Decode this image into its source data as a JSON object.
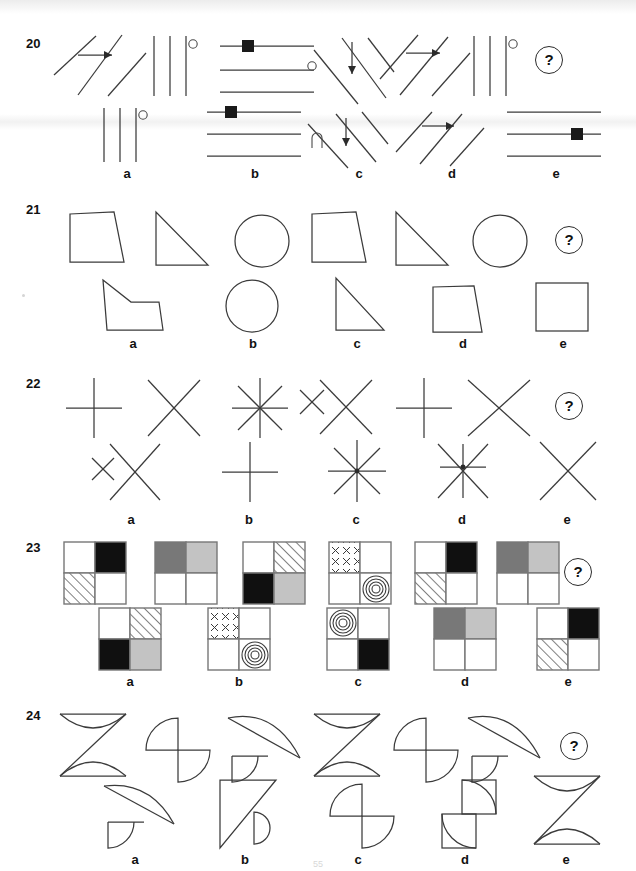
{
  "document": {
    "type": "non-verbal-reasoning-test",
    "page_number": "55",
    "question_mark_label": "?",
    "option_letters": [
      "a",
      "b",
      "c",
      "d",
      "e"
    ]
  },
  "rows": [
    {
      "number": "20",
      "theme": "line-groups",
      "problem_figures": [
        {
          "name": "three-diagonal-lines-with-arrow",
          "desc": "three parallel diagonal lines rising right, arrow pointing right"
        },
        {
          "name": "three-vertical-lines-with-circle",
          "desc": "three vertical lines, small open circle at top right"
        },
        {
          "name": "three-horizontal-lines-with-square",
          "desc": "three horizontal lines, small black square on top line"
        },
        {
          "name": "diagonal-lines-with-circle-and-down-arrow",
          "desc": "diagonal lines falling right, open circle left, down arrow"
        },
        {
          "name": "diagonal-lines-with-arrow-right",
          "desc": "three diagonal lines rising right, arrow pointing right"
        },
        {
          "name": "three-vertical-lines-with-circle-2",
          "desc": "three vertical lines, small open circle at top right"
        }
      ],
      "options": [
        {
          "letter": "a",
          "name": "three-vertical-lines-circle",
          "desc": "three vertical lines with small open circle"
        },
        {
          "letter": "b",
          "name": "three-horizontal-lines-square",
          "desc": "three horizontal lines with black square on top line"
        },
        {
          "letter": "c",
          "name": "diagonals-arc-down-arrow",
          "desc": "diagonal lines falling right with arc and down arrow"
        },
        {
          "letter": "d",
          "name": "diagonals-right-arrow",
          "desc": "diagonal lines rising right with right arrow"
        },
        {
          "letter": "e",
          "name": "three-horizontal-lines-square-low",
          "desc": "three horizontal lines with black square on bottom line"
        }
      ]
    },
    {
      "number": "21",
      "theme": "closed-shapes",
      "problem_figures": [
        {
          "name": "trapezoid",
          "desc": "trapezium, slanted right side"
        },
        {
          "name": "right-triangle",
          "desc": "right-angled triangle, vertical left edge"
        },
        {
          "name": "circle",
          "desc": "ellipse / circle"
        },
        {
          "name": "trapezoid-2",
          "desc": "trapezium, slanted right side"
        },
        {
          "name": "right-triangle-2",
          "desc": "right-angled triangle, vertical left edge"
        },
        {
          "name": "circle-2",
          "desc": "ellipse / circle"
        }
      ],
      "options": [
        {
          "letter": "a",
          "name": "irregular-pentagon",
          "desc": "irregular five-sided concave shape"
        },
        {
          "letter": "b",
          "name": "circle-option",
          "desc": "circle"
        },
        {
          "letter": "c",
          "name": "right-triangle-option",
          "desc": "right-angled triangle"
        },
        {
          "letter": "d",
          "name": "trapezoid-option",
          "desc": "trapezium"
        },
        {
          "letter": "e",
          "name": "square-option",
          "desc": "square"
        }
      ]
    },
    {
      "number": "22",
      "theme": "crossed-lines",
      "problem_figures": [
        {
          "name": "plus-cross",
          "desc": "upright cross (plus)"
        },
        {
          "name": "x-cross",
          "desc": "diagonal cross (X)"
        },
        {
          "name": "eight-point-asterisk",
          "desc": "eight-pointed asterisk"
        },
        {
          "name": "small-x-and-large-x",
          "desc": "small x beside large X"
        },
        {
          "name": "plus-cross-2",
          "desc": "upright cross (plus)"
        },
        {
          "name": "x-cross-2",
          "desc": "diagonal cross (X)"
        }
      ],
      "options": [
        {
          "letter": "a",
          "name": "small-x-and-large-x-option",
          "desc": "small x beside large X"
        },
        {
          "letter": "b",
          "name": "plus-cross-option",
          "desc": "upright cross"
        },
        {
          "letter": "c",
          "name": "eight-point-asterisk-option",
          "desc": "eight-pointed asterisk"
        },
        {
          "letter": "d",
          "name": "six-point-asterisk-option",
          "desc": "six-pointed asterisk"
        },
        {
          "letter": "e",
          "name": "x-cross-option",
          "desc": "diagonal cross (X)"
        }
      ]
    },
    {
      "number": "23",
      "theme": "four-cell-grids",
      "problem_figures": [
        {
          "name": "grid-white-black-hatch-white",
          "cells": [
            "white",
            "black",
            "hatch",
            "white"
          ]
        },
        {
          "name": "grid-darkgrey-lightgrey-white-white",
          "cells": [
            "darkgrey",
            "lightgrey",
            "white",
            "white"
          ]
        },
        {
          "name": "grid-white-hatch-black-lightgrey",
          "cells": [
            "white",
            "hatch",
            "black",
            "lightgrey"
          ]
        },
        {
          "name": "grid-crosses-white-white-rings",
          "cells": [
            "crosses",
            "white",
            "white",
            "rings"
          ]
        },
        {
          "name": "grid-white-black-hatch-white-2",
          "cells": [
            "white",
            "black",
            "hatch",
            "white"
          ]
        },
        {
          "name": "grid-darkgrey-lightgrey-white-white-2",
          "cells": [
            "darkgrey",
            "lightgrey",
            "white",
            "white"
          ]
        }
      ],
      "options": [
        {
          "letter": "a",
          "name": "grid-option-a",
          "cells": [
            "white",
            "hatch",
            "black",
            "lightgrey"
          ]
        },
        {
          "letter": "b",
          "name": "grid-option-b",
          "cells": [
            "crosses",
            "white",
            "white",
            "rings"
          ]
        },
        {
          "letter": "c",
          "name": "grid-option-c",
          "cells": [
            "rings",
            "white",
            "white",
            "black"
          ]
        },
        {
          "letter": "d",
          "name": "grid-option-d",
          "cells": [
            "darkgrey",
            "lightgrey",
            "white",
            "white"
          ]
        },
        {
          "letter": "e",
          "name": "grid-option-e",
          "cells": [
            "white",
            "black",
            "hatch",
            "white"
          ]
        }
      ]
    },
    {
      "number": "24",
      "theme": "arcs-and-angles",
      "problem_figures": [
        {
          "name": "z-with-arcs",
          "desc": "Z shape formed with two concave arcs"
        },
        {
          "name": "pinwheel-quarters",
          "desc": "two quarter-circle pinwheel"
        },
        {
          "name": "leaf-over-quarter",
          "desc": "large lens/leaf over small quarter circle"
        },
        {
          "name": "z-with-arcs-2",
          "desc": "Z shape formed with two concave arcs"
        },
        {
          "name": "pinwheel-quarters-2",
          "desc": "two quarter-circle pinwheel"
        },
        {
          "name": "leaf-over-quarter-2",
          "desc": "large lens/leaf over small quarter circle"
        }
      ],
      "options": [
        {
          "letter": "a",
          "name": "leaf-over-quarter-option",
          "desc": "large lens/leaf over small quarter circle"
        },
        {
          "letter": "b",
          "name": "triangle-with-half-circle",
          "desc": "right triangle with half circle on hypotenuse"
        },
        {
          "letter": "c",
          "name": "pinwheel-quarters-option",
          "desc": "two quarter-circle pinwheel"
        },
        {
          "letter": "d",
          "name": "two-squares-with-arcs",
          "desc": "two offset squares each with a quarter arc"
        },
        {
          "letter": "e",
          "name": "z-with-arcs-option",
          "desc": "Z shape formed with two concave arcs"
        }
      ]
    }
  ],
  "colors": {
    "ink": "#3b3b3b",
    "black_cell": "#101010",
    "dark_grey_cell": "#787878",
    "light_grey_cell": "#c3c3c3",
    "grid_border": "#777777",
    "page_background": "#ffffff"
  }
}
